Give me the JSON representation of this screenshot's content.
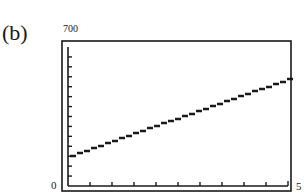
{
  "figure": {
    "panel_label": "(b)"
  },
  "chart_data": {
    "type": "line",
    "title": "",
    "xlabel": "",
    "ylabel": "",
    "xlim": [
      0,
      50
    ],
    "ylim": [
      0,
      700
    ],
    "x_tick_step": 5,
    "y_tick_step": 50,
    "tick_labels": {
      "y_max": "700",
      "y_min": "0",
      "x_max": "5"
    },
    "grid": false,
    "legend": null,
    "style": "graphing-calculator screen (stepped/pixelated line)",
    "series": [
      {
        "name": "line",
        "x": [
          0,
          50
        ],
        "y": [
          150,
          540
        ]
      }
    ]
  }
}
